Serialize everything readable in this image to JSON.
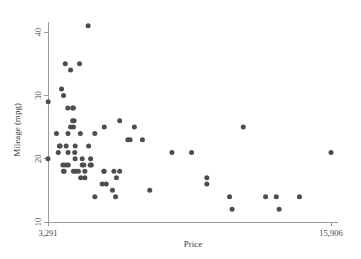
{
  "chart_data": {
    "type": "scatter",
    "title": "",
    "xlabel": "Price",
    "ylabel": "Mileage (mpg)",
    "xlim": [
      3291,
      15906
    ],
    "ylim": [
      10,
      41.6
    ],
    "grid": false,
    "legend": null,
    "marker_color": "#4d4d4d",
    "axis_color": "#9a9a9a",
    "xticks": [
      3291,
      15906
    ],
    "xticklabels": [
      "3,291",
      "15,906"
    ],
    "yticks": [
      10,
      20,
      30,
      40
    ],
    "yticklabels": [
      "10",
      "20",
      "30",
      "40"
    ],
    "n_points": 74,
    "points": [
      {
        "x": 4099,
        "y": 22
      },
      {
        "x": 4749,
        "y": 17
      },
      {
        "x": 3799,
        "y": 22
      },
      {
        "x": 4816,
        "y": 20
      },
      {
        "x": 7827,
        "y": 15
      },
      {
        "x": 5788,
        "y": 18
      },
      {
        "x": 4453,
        "y": 26
      },
      {
        "x": 5189,
        "y": 20
      },
      {
        "x": 10372,
        "y": 16
      },
      {
        "x": 4082,
        "y": 19
      },
      {
        "x": 11385,
        "y": 14
      },
      {
        "x": 14500,
        "y": 14
      },
      {
        "x": 15906,
        "y": 21
      },
      {
        "x": 3299,
        "y": 29
      },
      {
        "x": 5705,
        "y": 16
      },
      {
        "x": 4504,
        "y": 22
      },
      {
        "x": 5104,
        "y": 22
      },
      {
        "x": 3667,
        "y": 24
      },
      {
        "x": 3955,
        "y": 19
      },
      {
        "x": 3984,
        "y": 30
      },
      {
        "x": 4010,
        "y": 18
      },
      {
        "x": 5886,
        "y": 16
      },
      {
        "x": 6342,
        "y": 17
      },
      {
        "x": 4389,
        "y": 28
      },
      {
        "x": 4187,
        "y": 21
      },
      {
        "x": 11497,
        "y": 12
      },
      {
        "x": 13594,
        "y": 12
      },
      {
        "x": 13466,
        "y": 14
      },
      {
        "x": 3829,
        "y": 22
      },
      {
        "x": 5379,
        "y": 14
      },
      {
        "x": 6165,
        "y": 15
      },
      {
        "x": 4516,
        "y": 18
      },
      {
        "x": 6303,
        "y": 14
      },
      {
        "x": 3291,
        "y": 20
      },
      {
        "x": 8814,
        "y": 21
      },
      {
        "x": 5172,
        "y": 19
      },
      {
        "x": 4733,
        "y": 24
      },
      {
        "x": 4890,
        "y": 19
      },
      {
        "x": 4181,
        "y": 24
      },
      {
        "x": 4195,
        "y": 19
      },
      {
        "x": 10371,
        "y": 17
      },
      {
        "x": 4647,
        "y": 18
      },
      {
        "x": 4425,
        "y": 25
      },
      {
        "x": 4482,
        "y": 21
      },
      {
        "x": 6486,
        "y": 26
      },
      {
        "x": 4060,
        "y": 35
      },
      {
        "x": 4697,
        "y": 35
      },
      {
        "x": 4296,
        "y": 34
      },
      {
        "x": 4296,
        "y": 25
      },
      {
        "x": 5799,
        "y": 25
      },
      {
        "x": 7140,
        "y": 25
      },
      {
        "x": 6850,
        "y": 23
      },
      {
        "x": 6950,
        "y": 23
      },
      {
        "x": 7500,
        "y": 23
      },
      {
        "x": 11995,
        "y": 25
      },
      {
        "x": 9690,
        "y": 21
      },
      {
        "x": 5079,
        "y": 41
      },
      {
        "x": 4424,
        "y": 28
      },
      {
        "x": 4172,
        "y": 28
      },
      {
        "x": 3895,
        "y": 31
      },
      {
        "x": 4389,
        "y": 26
      },
      {
        "x": 5379,
        "y": 24
      },
      {
        "x": 4499,
        "y": 20
      },
      {
        "x": 4816,
        "y": 19
      },
      {
        "x": 5222,
        "y": 19
      },
      {
        "x": 5788,
        "y": 18
      },
      {
        "x": 6229,
        "y": 18
      },
      {
        "x": 6486,
        "y": 18
      },
      {
        "x": 4934,
        "y": 17
      },
      {
        "x": 3748,
        "y": 21
      },
      {
        "x": 3984,
        "y": 18
      },
      {
        "x": 4425,
        "y": 18
      },
      {
        "x": 12990,
        "y": 14
      },
      {
        "x": 4934,
        "y": 18
      }
    ]
  },
  "axes": {
    "x_label": "Price",
    "y_label": "Mileage (mpg)",
    "x_min_label": "3,291",
    "x_max_label": "15,906",
    "y_tick_10": "10",
    "y_tick_20": "20",
    "y_tick_30": "30",
    "y_tick_40": "40"
  }
}
